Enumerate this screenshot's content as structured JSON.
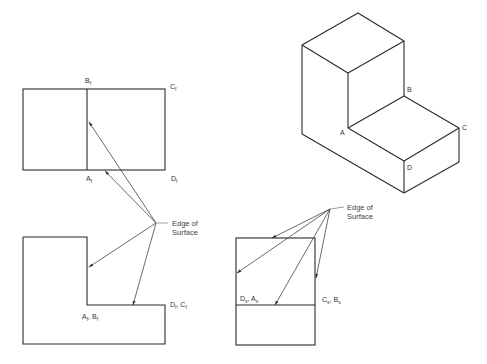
{
  "diagram": {
    "type": "orthographic-projection-with-isometric",
    "colors": {
      "line": "#2a2a2a",
      "leader": "#444444",
      "text": "#333333",
      "background": "#ffffff"
    },
    "front_view": {
      "labels": {
        "b": {
          "base": "B",
          "sub": "f"
        },
        "c": {
          "base": "C",
          "sub": "f"
        },
        "a": {
          "base": "A",
          "sub": "f"
        },
        "d": {
          "base": "D",
          "sub": "f"
        }
      }
    },
    "top_view": {
      "labels": {
        "ab": {
          "t1": "A",
          "s1": "f",
          "sep": ", ",
          "t2": "B",
          "s2": "f"
        },
        "dc": {
          "t1": "D",
          "s1": "f",
          "sep": ", ",
          "t2": "C",
          "s2": "f"
        }
      }
    },
    "side_view": {
      "labels": {
        "da": {
          "t1": "D",
          "s1": "s",
          "sep": ", ",
          "t2": "A",
          "s2": "s"
        },
        "cb": {
          "t1": "C",
          "s1": "s",
          "sep": ", ",
          "t2": "B",
          "s2": "s"
        }
      }
    },
    "isometric_view": {
      "labels": {
        "a": "A",
        "b": "B",
        "c": "C",
        "d": "D"
      }
    },
    "annotations": {
      "edge_left": {
        "line1": "Edge of",
        "line2": "Surface"
      },
      "edge_right": {
        "line1": "Edge of",
        "line2": "Surface"
      }
    }
  }
}
